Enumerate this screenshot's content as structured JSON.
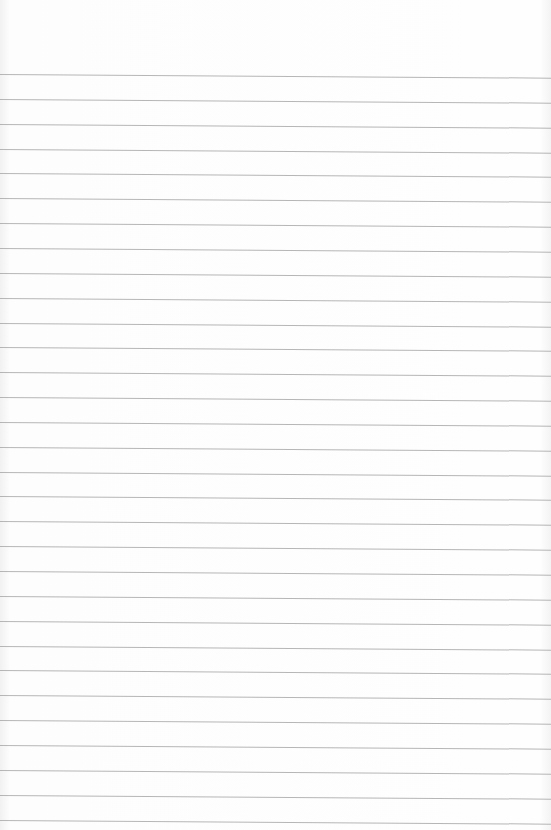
{
  "paper": {
    "type": "lined-notepaper",
    "line_count": 31,
    "first_line_y": 74,
    "line_spacing": 24.85,
    "line_color": "#a9a9a9",
    "background_color": "#fdfdfd"
  }
}
